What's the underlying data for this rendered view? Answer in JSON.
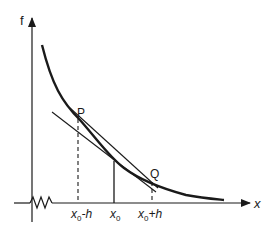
{
  "diagram": {
    "y_axis_label": "f",
    "x_axis_label": "x",
    "points": {
      "p": "P",
      "q": "Q"
    },
    "ticks": {
      "left": {
        "base": "x",
        "sub": "0",
        "suffix": "-h"
      },
      "center": {
        "base": "x",
        "sub": "0",
        "suffix": ""
      },
      "right": {
        "base": "x",
        "sub": "0",
        "suffix": "+h"
      }
    },
    "colors": {
      "ink": "#1a1a1a",
      "background": "#ffffff"
    }
  }
}
